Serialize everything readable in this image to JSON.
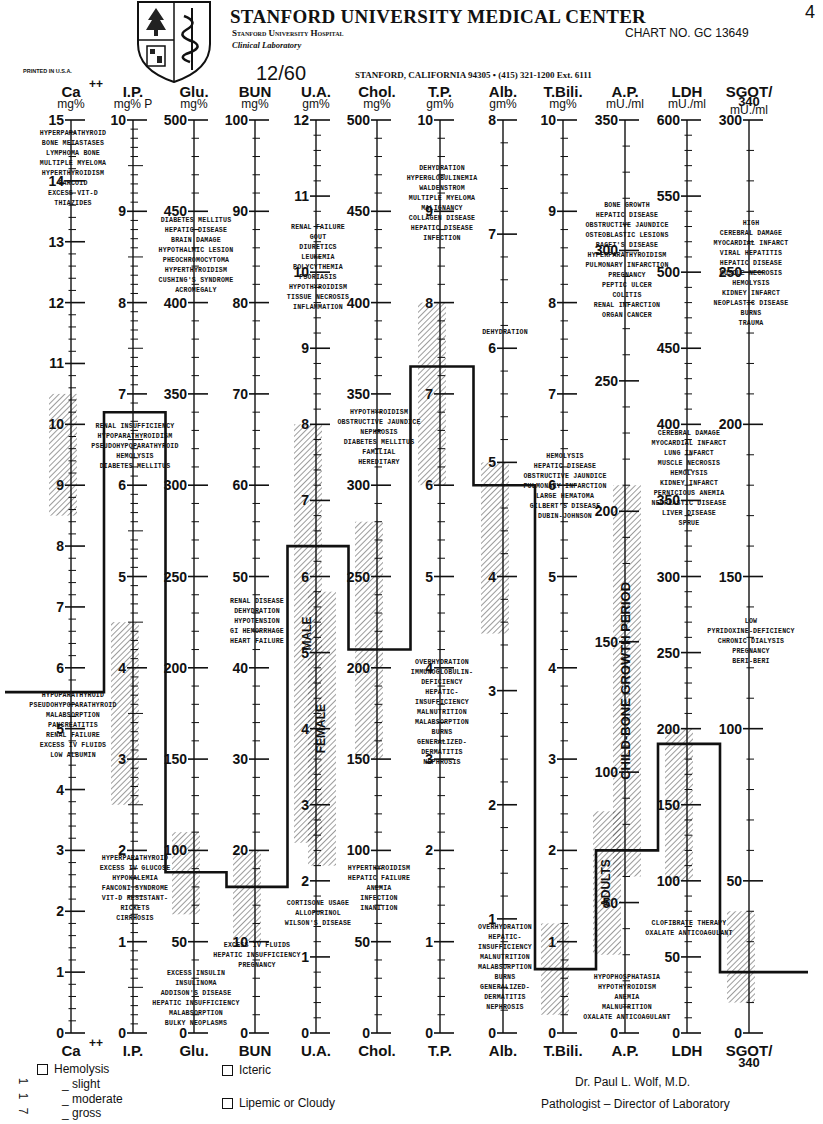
{
  "header": {
    "title": "STANFORD UNIVERSITY MEDICAL CENTER",
    "subtitle": "Stanford University Hospital",
    "subtitle2": "Clinical Laboratory",
    "chart_no": "CHART NO. GC 13649",
    "corner_mark": "4",
    "date": "12/60",
    "address": "STANFORD, CALIFORNIA 94305 • (415) 321-1200 Ext. 6111",
    "printed": "PRINTED IN U.S.A."
  },
  "footer": {
    "hemolysis_label": "Hemolysis",
    "severity": [
      "_ slight",
      "_ moderate",
      "_ gross"
    ],
    "side_numbers": [
      "1",
      "1",
      "7"
    ],
    "icteric_label": "Icteric",
    "lipemic_label": "Lipemic or Cloudy",
    "signature_name": "Dr. Paul L. Wolf, M.D.",
    "signature_title": "Pathologist – Director of Laboratory"
  },
  "chart_data": {
    "type": "line",
    "xlabel": "",
    "ylabel": "",
    "grid": false,
    "layout": {
      "axis_top_y": 120,
      "axis_bottom_y": 1033,
      "header_label_y": 97,
      "unit_label_y": 108,
      "footer_label_y": 1056
    },
    "categories": [
      "Ca++",
      "I.P.",
      "Glu.",
      "BUN",
      "U.A.",
      "Chol.",
      "T.P.",
      "Alb.",
      "T.Bili.",
      "A.P.",
      "LDH",
      "SGOT/340"
    ],
    "axes": [
      {
        "name": "Ca",
        "sup": "++",
        "unit": "mg%",
        "x": 71,
        "min": 0,
        "max": 15,
        "major": 1,
        "minor": 0.2,
        "labels": [
          0,
          1,
          2,
          3,
          4,
          5,
          6,
          7,
          8,
          9,
          10,
          11,
          12,
          13,
          14,
          15
        ]
      },
      {
        "name": "I.P.",
        "unit": "mg% P",
        "x": 133,
        "min": 0,
        "max": 10,
        "major": 1,
        "minor": 0.1,
        "labels": [
          0,
          1,
          2,
          3,
          4,
          5,
          6,
          7,
          8,
          9,
          10
        ]
      },
      {
        "name": "Glu.",
        "unit": "mg%",
        "x": 194,
        "min": 0,
        "max": 500,
        "major": 50,
        "minor": 10,
        "labels": [
          0,
          50,
          100,
          150,
          200,
          250,
          300,
          350,
          400,
          450,
          500
        ]
      },
      {
        "name": "BUN",
        "unit": "mg%",
        "x": 255,
        "min": 0,
        "max": 100,
        "major": 10,
        "minor": 2,
        "labels": [
          0,
          10,
          20,
          30,
          40,
          50,
          60,
          70,
          80,
          90,
          100
        ]
      },
      {
        "name": "U.A.",
        "unit": "gm%",
        "x": 316,
        "min": 0,
        "max": 12,
        "major": 1,
        "minor": 0.2,
        "labels": [
          0,
          1,
          2,
          3,
          4,
          5,
          6,
          7,
          8,
          9,
          10,
          11,
          12
        ]
      },
      {
        "name": "Chol.",
        "unit": "mg%",
        "x": 377,
        "min": 0,
        "max": 500,
        "major": 50,
        "minor": 10,
        "labels": [
          0,
          50,
          100,
          150,
          200,
          250,
          300,
          350,
          400,
          450,
          500
        ]
      },
      {
        "name": "T.P.",
        "unit": "gm%",
        "x": 440,
        "min": 0,
        "max": 10,
        "major": 1,
        "minor": 0.2,
        "labels": [
          0,
          1,
          2,
          3,
          4,
          5,
          6,
          7,
          8,
          9,
          10
        ]
      },
      {
        "name": "Alb.",
        "unit": "gm%",
        "x": 503,
        "min": 0,
        "max": 8,
        "major": 1,
        "minor": 0.2,
        "labels": [
          0,
          1,
          2,
          3,
          4,
          5,
          6,
          7,
          8
        ]
      },
      {
        "name": "T.Bili.",
        "unit": "mg%",
        "x": 563,
        "min": 0,
        "max": 10,
        "major": 1,
        "minor": 0.2,
        "labels": [
          0,
          1,
          2,
          3,
          4,
          5,
          6,
          7,
          8,
          9,
          10
        ]
      },
      {
        "name": "A.P.",
        "unit": "mU./ml",
        "x": 625,
        "min": 0,
        "max": 350,
        "major": 50,
        "minor": 10,
        "labels": [
          0,
          50,
          100,
          150,
          200,
          250,
          300,
          350
        ]
      },
      {
        "name": "LDH",
        "unit": "mU./ml",
        "x": 687,
        "min": 0,
        "max": 600,
        "major": 50,
        "minor": 10,
        "labels": [
          0,
          50,
          100,
          150,
          200,
          250,
          300,
          350,
          400,
          450,
          500,
          550,
          600
        ]
      },
      {
        "name": "SGOT/",
        "sub": "340",
        "unit": "mU./ml",
        "x": 749,
        "min": 0,
        "max": 300,
        "major": 50,
        "minor": 10,
        "labels": [
          0,
          50,
          100,
          150,
          200,
          250,
          300
        ]
      }
    ],
    "normal_ranges": [
      {
        "axis": "Ca",
        "from": 8.5,
        "to": 10.5
      },
      {
        "axis": "I.P.",
        "from": 2.5,
        "to": 4.5
      },
      {
        "axis": "Glu.",
        "from": 65,
        "to": 110
      },
      {
        "axis": "BUN",
        "from": 10,
        "to": 20
      },
      {
        "axis": "U.A.",
        "label": "MALE",
        "from": 2.5,
        "to": 8
      },
      {
        "axis": "U.A.",
        "label": "FEMALE",
        "from": 2.2,
        "to": 5.8,
        "offset": 14
      },
      {
        "axis": "Chol.",
        "from": 150,
        "to": 280
      },
      {
        "axis": "T.P.",
        "from": 6,
        "to": 8
      },
      {
        "axis": "Alb.",
        "from": 3.5,
        "to": 5
      },
      {
        "axis": "T.Bili.",
        "from": 0.2,
        "to": 1.2
      },
      {
        "axis": "A.P.",
        "label": "ADULTS",
        "from": 30,
        "to": 85,
        "offset": -10
      },
      {
        "axis": "A.P.",
        "label": "CHILD-BONE GROWTH PERIOD",
        "from": 60,
        "to": 210,
        "offset": 10
      },
      {
        "axis": "LDH",
        "from": 100,
        "to": 200
      },
      {
        "axis": "SGOT/340",
        "from": 10,
        "to": 40
      }
    ],
    "patient_values": [
      {
        "axis": "Ca++",
        "value": 5.6
      },
      {
        "axis": "I.P.",
        "value": 6.8
      },
      {
        "axis": "Glu.",
        "value": 88
      },
      {
        "axis": "BUN",
        "value": 16
      },
      {
        "axis": "U.A.",
        "value": 6.4
      },
      {
        "axis": "Chol.",
        "value": 210
      },
      {
        "axis": "T.P.",
        "value": 7.3
      },
      {
        "axis": "Alb.",
        "value": 4.8
      },
      {
        "axis": "T.Bili.",
        "value": 0.7
      },
      {
        "axis": "A.P.",
        "value": 70
      },
      {
        "axis": "LDH",
        "value": 190
      },
      {
        "axis": "SGOT/340",
        "value": 20
      }
    ],
    "series": [
      {
        "name": "Patient profile",
        "values": [
          5.6,
          6.8,
          88,
          16,
          6.4,
          210,
          7.3,
          4.8,
          0.7,
          70,
          190,
          20
        ]
      }
    ],
    "annotations": [
      {
        "axis": "Ca",
        "y": 135,
        "lines": [
          "HYPERPARATHYROID",
          "BONE METASTASES",
          "LYMPHOMA BONE",
          "MULTIPLE MYELOMA",
          "HYPERTHYROIDISM",
          "SARCOID",
          "EXCESS VIT-D",
          "THIAZIDES"
        ]
      },
      {
        "axis": "Ca",
        "y": 697,
        "lines": [
          "HYPOPARATHYROID",
          "PSEUDOHYPOPARATHYROID",
          "MALABSORPTION",
          "PANCREATITIS",
          "RENAL FAILURE",
          "EXCESS IV FLUIDS",
          "LOW ALBUMIN"
        ]
      },
      {
        "axis": "I.P.",
        "y": 428,
        "lines": [
          "RENAL INSUFFICIENCY",
          "HYPOPARATHYROIDISM",
          "PSEUDOHYPOPARATHYROID",
          "HEMOLYSIS",
          "DIABETES MELLITUS"
        ]
      },
      {
        "axis": "I.P.",
        "y": 860,
        "lines": [
          "HYPERPARATHYROID",
          "EXCESS IV GLUCOSE",
          "HYPOKALEMIA",
          "FANCONI SYNDROME",
          "VIT-D RESISTANT-",
          "RICKETS",
          "CIRRHOSIS"
        ]
      },
      {
        "axis": "Glu.",
        "y": 222,
        "lines": [
          "DIABETES MELLITUS",
          "HEPATIC DISEASE",
          "BRAIN DAMAGE",
          "HYPOTHALMIC LESION",
          "PHEOCHROMOCYTOMA",
          "HYPERTHYROIDISM",
          "CUSHING'S SYNDROME",
          "ACROMEGALY"
        ]
      },
      {
        "axis": "Glu.",
        "y": 975,
        "lines": [
          "EXCESS INSULIN",
          "INSULINOMA",
          "ADDISON'S DISEASE",
          "HEPATIC INSUFFICIENCY",
          "MALABSORPTION",
          "BULKY NEOPLASMS"
        ]
      },
      {
        "axis": "BUN",
        "y": 603,
        "lines": [
          "RENAL DISEASE",
          "DEHYDRATION",
          "HYPOTENSION",
          "GI HEMORRHAGE",
          "HEART FAILURE"
        ]
      },
      {
        "axis": "BUN",
        "y": 947,
        "lines": [
          "EXCESS IV FLUIDS",
          "HEPATIC INSUFFICIENCY",
          "PREGNANCY"
        ]
      },
      {
        "axis": "U.A.",
        "y": 229,
        "lines": [
          "RENAL FAILURE",
          "GOUT",
          "DIURETICS",
          "LEUKEMIA",
          "POLYCYTHEMIA",
          "PSORIASIS",
          "HYPOTHYROIDISM",
          "TISSUE NECROSIS",
          "INFLAMMATION"
        ]
      },
      {
        "axis": "U.A.",
        "y": 905,
        "lines": [
          "CORTISONE USAGE",
          "ALLOPURINOL",
          "WILSON'S DISEASE"
        ]
      },
      {
        "axis": "Chol.",
        "y": 414,
        "lines": [
          "HYPOTHYROIDISM",
          "OBSTRUCTIVE JAUNDICE",
          "NEPHROSIS",
          "DIABETES MELLITUS",
          "FAMILIAL",
          "HEREDITARY"
        ]
      },
      {
        "axis": "Chol.",
        "y": 870,
        "lines": [
          "HYPERTHYROIDISM",
          "HEPATIC FAILURE",
          "ANEMIA",
          "INFECTION",
          "INANITION"
        ]
      },
      {
        "axis": "T.P.",
        "y": 170,
        "lines": [
          "DEHYDRATION",
          "HYPERGLOBULINEMIA",
          "WALDENSTROM",
          "MULTIPLE MYELOMA",
          "MALIGNANCY",
          "COLLAGEN DISEASE",
          "HEPATIC DISEASE",
          "INFECTION"
        ]
      },
      {
        "axis": "T.P.",
        "y": 664,
        "lines": [
          "OVERHYDRATION",
          "IMMUNOGLOBULIN-",
          "DEFICIENCY",
          "HEPATIC-",
          "INSUFFICIENCY",
          "MALNUTRITION",
          "MALABSORPTION",
          "BURNS",
          "GENERALIZED-",
          "DERMATITIS",
          "NEPHROSIS"
        ]
      },
      {
        "axis": "Alb.",
        "y": 334,
        "lines": [
          "DEHYDRATION"
        ]
      },
      {
        "axis": "Alb.",
        "y": 929,
        "lines": [
          "OVERHYDRATION",
          "HEPATIC-",
          "INSUFFICIENCY",
          "MALNUTRITION",
          "MALABSORPTION",
          "BURNS",
          "GENERALIZED-",
          "DERMATITIS",
          "NEPHROSIS"
        ]
      },
      {
        "axis": "T.Bili.",
        "y": 458,
        "lines": [
          "HEMOLYSIS",
          "HEPATIC DISEASE",
          "OBSTRUCTIVE JAUNDICE",
          "PULMONARY INFARCTION",
          "LARGE HEMATOMA",
          "GILBERT'S DISEASE",
          "DUBIN-JOHNSON"
        ]
      },
      {
        "axis": "A.P.",
        "y": 207,
        "lines": [
          "BONE GROWTH",
          "HEPATIC DISEASE",
          "OBSTRUCTIVE JAUNDICE",
          "OSTEOBLASTIC LESIONS",
          "PAGET'S DISEASE",
          "HYPERPARATHYROIDISM",
          "PULMONARY INFARCTION",
          "PREGNANCY",
          "PEPTIC ULCER",
          "COLITIS",
          "RENAL INFARCTION",
          "ORGAN CANCER"
        ]
      },
      {
        "axis": "A.P.",
        "y": 979,
        "lines": [
          "HYPOPHOSPHATASIA",
          "HYPOTHYROIDISM",
          "ANEMIA",
          "MALNUTRITION",
          "OXALATE ANTICOAGULANT"
        ]
      },
      {
        "axis": "LDH",
        "y": 435,
        "lines": [
          "CEREBRAL DAMAGE",
          "MYOCARDIAL INFARCT",
          "LUNG INFARCT",
          "MUSCLE NECROSIS",
          "HEMOLYSIS",
          "KIDNEY INFARCT",
          "PERNICIOUS ANEMIA",
          "NEOPLASTIC DISEASE",
          "LIVER DISEASE",
          "SPRUE"
        ]
      },
      {
        "axis": "LDH",
        "y": 925,
        "lines": [
          "CLOFIBRATE THERAPY",
          "OXALATE ANTICOAGULANT"
        ]
      },
      {
        "axis": "SGOT/340",
        "y": 225,
        "lines": [
          "HIGH",
          "CEREBRAL DAMAGE",
          "MYOCARDIAL INFARCT",
          "VIRAL HEPATITIS",
          "HEPATIC DISEASE",
          "MUSCLE NECROSIS",
          "HEMOLYSIS",
          "KIDNEY INFARCT",
          "NEOPLASTIC DISEASE",
          "BURNS",
          "TRAUMA"
        ]
      },
      {
        "axis": "SGOT/340",
        "y": 623,
        "lines": [
          "LOW",
          "PYRIDOXINE-DEFICIENCY",
          "CHRONIC DIALYSIS",
          "PREGNANCY",
          "BERI-BERI"
        ]
      }
    ]
  }
}
